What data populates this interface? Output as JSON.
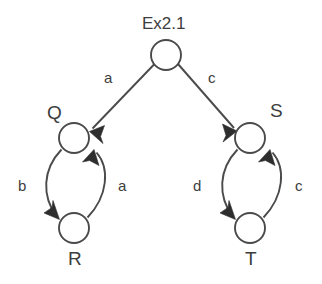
{
  "diagram": {
    "title": "Ex2.1",
    "type": "directed-graph",
    "background_color": "#ffffff",
    "stroke_color": "#4a4a4a",
    "arrow_color": "#2e2e2e",
    "nodes": [
      {
        "id": "root",
        "label": "Ex2.1",
        "label_position": "above",
        "cx": 166,
        "cy": 55,
        "r": 15
      },
      {
        "id": "Q",
        "label": "Q",
        "label_position": "upper-left",
        "cx": 74,
        "cy": 138,
        "r": 15
      },
      {
        "id": "R",
        "label": "R",
        "label_position": "below",
        "cx": 74,
        "cy": 228,
        "r": 15
      },
      {
        "id": "S",
        "label": "S",
        "label_position": "upper-right",
        "cx": 250,
        "cy": 138,
        "r": 15
      },
      {
        "id": "T",
        "label": "T",
        "label_position": "below",
        "cx": 250,
        "cy": 228,
        "r": 15
      }
    ],
    "edges": [
      {
        "from": "root",
        "to": "Q",
        "label": "a",
        "shape": "straight"
      },
      {
        "from": "root",
        "to": "S",
        "label": "c",
        "shape": "straight"
      },
      {
        "from": "Q",
        "to": "R",
        "label": "b",
        "shape": "curve-left"
      },
      {
        "from": "R",
        "to": "Q",
        "label": "a",
        "shape": "curve-right"
      },
      {
        "from": "S",
        "to": "T",
        "label": "d",
        "shape": "curve-left"
      },
      {
        "from": "T",
        "to": "S",
        "label": "c",
        "shape": "curve-right"
      }
    ]
  },
  "labels": {
    "title": "Ex2.1",
    "node_q": "Q",
    "node_r": "R",
    "node_s": "S",
    "node_t": "T",
    "edge_root_q": "a",
    "edge_root_s": "c",
    "edge_q_r": "b",
    "edge_r_q": "a",
    "edge_s_t": "d",
    "edge_t_s": "c"
  }
}
